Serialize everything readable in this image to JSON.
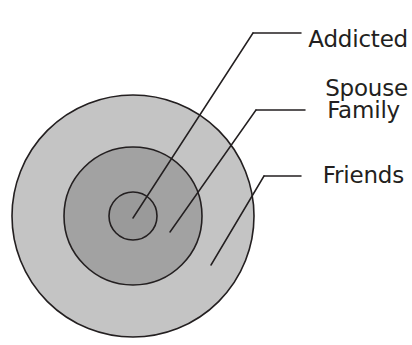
{
  "diagram": {
    "type": "concentric-circles",
    "background_color": "#ffffff",
    "stroke_color": "#231f20",
    "center": {
      "x": 133,
      "y": 216
    },
    "rings": [
      {
        "id": "friends",
        "label": "Friends",
        "order": 3,
        "radius": 121,
        "fill": "#c4c4c4",
        "stroke": "#231f20",
        "stroke_width": 1.6
      },
      {
        "id": "family",
        "label": "Family",
        "order": 2,
        "radius": 69,
        "fill": "#a2a2a2",
        "stroke": "#231f20",
        "stroke_width": 1.6
      },
      {
        "id": "addicted-spouse",
        "label": "Addicted Spouse",
        "label_line1": "Addicted",
        "label_line2": "Spouse",
        "order": 1,
        "radius": 24,
        "fill": "#9a9a9a",
        "stroke": "#231f20",
        "stroke_width": 1.6
      }
    ],
    "leader_lines": [
      {
        "id": "leader-addicted-spouse",
        "for": "addicted-spouse",
        "horizontal": {
          "x1": 253,
          "y1": 33,
          "x2": 301,
          "y2": 33
        },
        "diagonal": {
          "x1": 253,
          "y1": 33,
          "x2": 133,
          "y2": 218
        }
      },
      {
        "id": "leader-family",
        "for": "family",
        "horizontal": {
          "x1": 256,
          "y1": 110,
          "x2": 305,
          "y2": 110
        },
        "diagonal": {
          "x1": 256,
          "y1": 110,
          "x2": 170,
          "y2": 232
        }
      },
      {
        "id": "leader-friends",
        "for": "friends",
        "horizontal": {
          "x1": 264,
          "y1": 176,
          "x2": 301,
          "y2": 176
        },
        "diagonal": {
          "x1": 264,
          "y1": 176,
          "x2": 211,
          "y2": 265
        }
      }
    ]
  },
  "labels": {
    "addicted_spouse_line1": "Addicted",
    "addicted_spouse_line2": "Spouse",
    "family": "Family",
    "friends": "Friends"
  }
}
